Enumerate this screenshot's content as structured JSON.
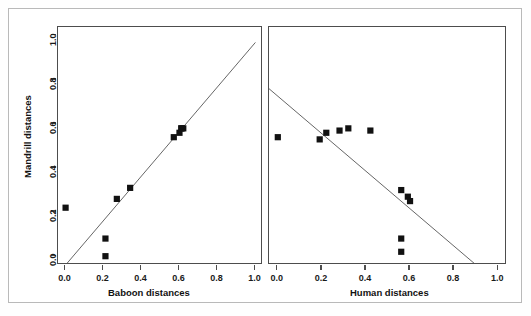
{
  "figure": {
    "background_color": "#ffffff",
    "frame_color": "#b9b9b9",
    "axis_color": "#4d4d4d",
    "point_color": "#111111",
    "line_color": "#555555",
    "ylabel": "Mandrill distances"
  },
  "axes": {
    "tick_labels": [
      "0.0",
      "0.2",
      "0.4",
      "0.6",
      "0.8",
      "1.0"
    ],
    "tick_values": [
      0.0,
      0.2,
      0.4,
      0.6,
      0.8,
      1.0
    ]
  },
  "chart_data": [
    {
      "type": "scatter",
      "panel": "left",
      "title": "",
      "xlabel": "Baboon distances",
      "ylabel": "Mandrill distances",
      "xlim": [
        -0.04,
        1.04
      ],
      "ylim": [
        -0.04,
        1.04
      ],
      "xticks": [
        0.0,
        0.2,
        0.4,
        0.6,
        0.8,
        1.0
      ],
      "yticks": [
        0.0,
        0.2,
        0.4,
        0.6,
        0.8,
        1.0
      ],
      "grid": false,
      "legend": "none",
      "x": [
        0.0,
        0.21,
        0.21,
        0.27,
        0.34,
        0.57,
        0.6,
        0.61,
        0.61,
        0.62
      ],
      "y": [
        0.22,
        0.08,
        0.0,
        0.26,
        0.31,
        0.54,
        0.56,
        0.58,
        0.58,
        0.58
      ],
      "fit_line": {
        "x0": 0.0,
        "y0": -0.04,
        "x1": 1.0,
        "y1": 0.97
      }
    },
    {
      "type": "scatter",
      "panel": "right",
      "title": "",
      "xlabel": "Human distances",
      "ylabel": "Mandrill distances",
      "xlim": [
        -0.04,
        1.04
      ],
      "ylim": [
        -0.04,
        1.04
      ],
      "xticks": [
        0.0,
        0.2,
        0.4,
        0.6,
        0.8,
        1.0
      ],
      "yticks": [
        0.0,
        0.2,
        0.4,
        0.6,
        0.8,
        1.0
      ],
      "grid": false,
      "legend": "none",
      "x": [
        0.0,
        0.19,
        0.22,
        0.28,
        0.32,
        0.42,
        0.56,
        0.59,
        0.6,
        0.56,
        0.56
      ],
      "y": [
        0.54,
        0.53,
        0.56,
        0.57,
        0.58,
        0.57,
        0.3,
        0.27,
        0.25,
        0.08,
        0.02
      ],
      "fit_line": {
        "x0": -0.04,
        "y0": 0.76,
        "x1": 0.9,
        "y1": -0.04
      }
    }
  ]
}
